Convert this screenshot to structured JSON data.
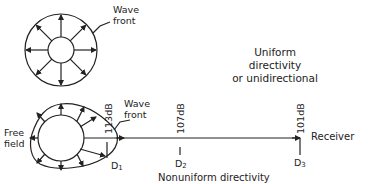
{
  "top_diagram": {
    "wave_front_label_line1": "Wave",
    "wave_front_label_line2": "front",
    "title_line1": "Uniform",
    "title_line2": "directivity",
    "title_line3": "or unidirectional"
  },
  "bottom_diagram": {
    "wave_front_label_line1": "Wave",
    "wave_front_label_line2": "front",
    "free_field_line1": "Free",
    "free_field_line2": "field",
    "receiver_label": "Receiver",
    "title": "Nonuniform directivity",
    "distances": [
      {
        "id": "D",
        "sub": "1",
        "level": "113dB"
      },
      {
        "id": "D",
        "sub": "2",
        "level": "107dB"
      },
      {
        "id": "D",
        "sub": "3",
        "level": "101dB"
      }
    ]
  },
  "colors": {
    "line": "#222222",
    "background": "#ffffff"
  }
}
